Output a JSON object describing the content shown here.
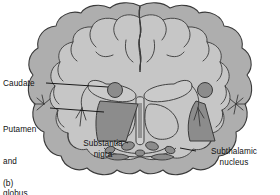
{
  "figure": {
    "caption": "(b)"
  },
  "labels": {
    "caudate": "Caudate",
    "putamen_line1": "Putamen",
    "putamen_line2": "and",
    "putamen_line3": "globus",
    "putamen_line4": "pallidus",
    "substantia_nigra": "Substantia\nnigra",
    "subthalamic_nucleus": "Subthalamic\nnucleus"
  },
  "colors": {
    "cortex_band": "#aeaeae",
    "interior": "#c6c6c6",
    "deep_nuclei": "#8c8c8c",
    "outline": "#3a3a3a",
    "text": "#111111",
    "background": "#ffffff"
  }
}
